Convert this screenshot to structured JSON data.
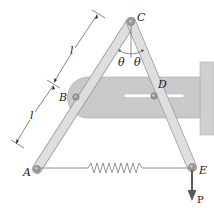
{
  "figure": {
    "type": "mechanism diagram",
    "labels": {
      "A": "A",
      "B": "B",
      "C": "C",
      "D": "D",
      "E": "E",
      "P": "P",
      "theta_left": "θ",
      "theta_right": "θ",
      "length_upper": "l",
      "length_lower": "l"
    },
    "colors": {
      "plate": "#c9c9c9",
      "plate_edge": "#a8a8a8",
      "bar": "#dcdcdc",
      "bar_edge": "#9a9a9a",
      "wall": "#cfcfcf",
      "pin": "#8a8a8a",
      "spring": "#888888",
      "arrow": "#5a5a5a",
      "dim": "#333333"
    }
  }
}
